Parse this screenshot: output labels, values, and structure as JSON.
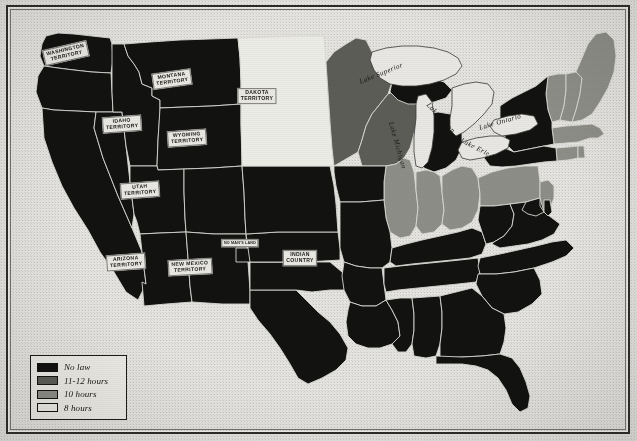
{
  "figure": {
    "type": "choropleth-map",
    "colors": {
      "no_law": "#121210",
      "hours_11_12": "#5d5d58",
      "hours_10": "#8e8e88",
      "hours_8": "#ececE6",
      "paper": "#e6e5e1",
      "border": "#2b2b29",
      "state_outline": "#d8d8d4"
    }
  },
  "legend": {
    "items": [
      {
        "label": "No law",
        "swatch": "#121210",
        "category": "no_law"
      },
      {
        "label": "11-12 hours",
        "swatch": "#5d5d58",
        "category": "hours_11_12"
      },
      {
        "label": "10 hours",
        "swatch": "#8e8e88",
        "category": "hours_10"
      },
      {
        "label": "8 hours",
        "swatch": "#ececE6",
        "category": "hours_8"
      }
    ]
  },
  "territory_labels": [
    {
      "name": "washington-territory",
      "text": "WASHINGTON\nTERRITORY",
      "x": 66,
      "y": 53,
      "rotate": -13,
      "size": "normal"
    },
    {
      "name": "montana-territory",
      "text": "MONTANA\nTERRITORY",
      "x": 172,
      "y": 79,
      "rotate": -8,
      "size": "normal"
    },
    {
      "name": "dakota-territory",
      "text": "DAKOTA\nTERRITORY",
      "x": 257,
      "y": 96,
      "rotate": 0,
      "size": "normal"
    },
    {
      "name": "idaho-territory",
      "text": "IDAHO\nTERRITORY",
      "x": 122,
      "y": 124,
      "rotate": -4,
      "size": "normal"
    },
    {
      "name": "wyoming-territory",
      "text": "WYOMING\nTERRITORY",
      "x": 187,
      "y": 138,
      "rotate": -4,
      "size": "normal"
    },
    {
      "name": "utah-territory",
      "text": "UTAH\nTERRITORY",
      "x": 140,
      "y": 190,
      "rotate": -4,
      "size": "normal"
    },
    {
      "name": "arizona-territory",
      "text": "ARIZONA\nTERRITORY",
      "x": 126,
      "y": 262,
      "rotate": -4,
      "size": "normal"
    },
    {
      "name": "new-mexico-territory",
      "text": "NEW MEXICO\nTERRITORY",
      "x": 190,
      "y": 267,
      "rotate": -3,
      "size": "normal"
    },
    {
      "name": "no-mans-land",
      "text": "NO MAN'S LAND",
      "x": 240,
      "y": 243,
      "rotate": 0,
      "size": "tiny"
    },
    {
      "name": "indian-country",
      "text": "INDIAN\nCOUNTRY",
      "x": 300,
      "y": 258,
      "rotate": 0,
      "size": "normal"
    }
  ],
  "lake_labels": [
    {
      "name": "lake-superior",
      "text": "Lake Superior",
      "x": 383,
      "y": 82,
      "rotate": -22
    },
    {
      "name": "lake-michigan",
      "text": "Lake Michigan",
      "x": 415,
      "y": 122,
      "rotate": 74
    },
    {
      "name": "lake-huron",
      "text": "Lake Huron",
      "x": 447,
      "y": 104,
      "rotate": 47
    },
    {
      "name": "lake-erie",
      "text": "Lake Erie",
      "x": 477,
      "y": 140,
      "rotate": 27
    },
    {
      "name": "lake-ontario",
      "text": "Lake Ontario",
      "x": 501,
      "y": 128,
      "rotate": -16
    }
  ],
  "chart_data": {
    "type": "map",
    "categories": [
      "No law",
      "11-12 hours",
      "10 hours",
      "8 hours"
    ],
    "regions": [
      {
        "name": "Washington Territory",
        "category": "no_law"
      },
      {
        "name": "Oregon",
        "category": "no_law"
      },
      {
        "name": "California",
        "category": "no_law"
      },
      {
        "name": "Nevada",
        "category": "no_law"
      },
      {
        "name": "Idaho Territory",
        "category": "no_law"
      },
      {
        "name": "Montana Territory",
        "category": "no_law"
      },
      {
        "name": "Wyoming Territory",
        "category": "no_law"
      },
      {
        "name": "Utah Territory",
        "category": "no_law"
      },
      {
        "name": "Colorado",
        "category": "no_law"
      },
      {
        "name": "Arizona Territory",
        "category": "no_law"
      },
      {
        "name": "New Mexico Territory",
        "category": "no_law"
      },
      {
        "name": "Texas",
        "category": "no_law"
      },
      {
        "name": "Indian Country",
        "category": "no_law"
      },
      {
        "name": "Kansas",
        "category": "no_law"
      },
      {
        "name": "Nebraska",
        "category": "no_law"
      },
      {
        "name": "Dakota Territory",
        "category": "hours_8"
      },
      {
        "name": "Minnesota",
        "category": "hours_11_12"
      },
      {
        "name": "Wisconsin",
        "category": "hours_11_12"
      },
      {
        "name": "Iowa",
        "category": "no_law"
      },
      {
        "name": "Missouri",
        "category": "no_law"
      },
      {
        "name": "Arkansas",
        "category": "no_law"
      },
      {
        "name": "Louisiana",
        "category": "no_law"
      },
      {
        "name": "Mississippi",
        "category": "no_law"
      },
      {
        "name": "Alabama",
        "category": "no_law"
      },
      {
        "name": "Tennessee",
        "category": "no_law"
      },
      {
        "name": "Kentucky",
        "category": "no_law"
      },
      {
        "name": "Illinois",
        "category": "hours_10"
      },
      {
        "name": "Indiana",
        "category": "hours_10"
      },
      {
        "name": "Ohio",
        "category": "hours_10"
      },
      {
        "name": "Michigan",
        "category": "no_law"
      },
      {
        "name": "Pennsylvania",
        "category": "hours_10"
      },
      {
        "name": "New York",
        "category": "no_law"
      },
      {
        "name": "West Virginia",
        "category": "no_law"
      },
      {
        "name": "Virginia",
        "category": "no_law"
      },
      {
        "name": "North Carolina",
        "category": "no_law"
      },
      {
        "name": "South Carolina",
        "category": "no_law"
      },
      {
        "name": "Georgia",
        "category": "no_law"
      },
      {
        "name": "Florida",
        "category": "no_law"
      },
      {
        "name": "Maryland",
        "category": "no_law"
      },
      {
        "name": "Delaware",
        "category": "no_law"
      },
      {
        "name": "New Jersey",
        "category": "hours_10"
      },
      {
        "name": "Connecticut",
        "category": "hours_10"
      },
      {
        "name": "Rhode Island",
        "category": "hours_10"
      },
      {
        "name": "Massachusetts",
        "category": "hours_10"
      },
      {
        "name": "Vermont",
        "category": "hours_10"
      },
      {
        "name": "New Hampshire",
        "category": "hours_10"
      },
      {
        "name": "Maine",
        "category": "hours_10"
      }
    ]
  }
}
